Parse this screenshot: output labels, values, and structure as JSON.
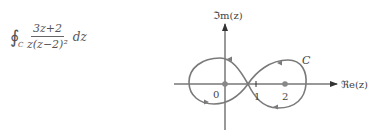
{
  "formula": {
    "integral_symbol": "∮",
    "contour": "C",
    "numerator": "3z+2",
    "denominator": "z(z−2)²",
    "differential": "dz"
  },
  "diagram": {
    "y_axis_label": "ℑm(z)",
    "x_axis_label": "ℜe(z)",
    "curve_label": "C",
    "tick_labels": [
      "0",
      "1",
      "2"
    ],
    "marked_points": [
      0,
      2
    ],
    "colors": {
      "curve": "#7a7a7a",
      "axis": "#333333",
      "point": "#888888"
    }
  }
}
